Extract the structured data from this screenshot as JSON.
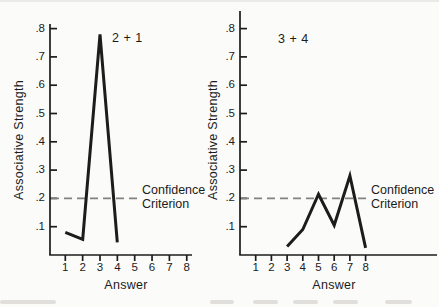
{
  "figure": {
    "background": "#fbfbf9",
    "ink": "#1c1c1c",
    "criterion_dash_color": "#828282"
  },
  "chart_data": [
    {
      "type": "line",
      "title": "2 + 1",
      "xlabel": "Answer",
      "ylabel": "Associative Strength",
      "x_tick_labels": [
        "1",
        "2",
        "3",
        "4",
        "5",
        "6",
        "7",
        "8"
      ],
      "y_tick_labels": [
        ".1",
        ".2",
        ".3",
        ".4",
        ".5",
        ".6",
        ".7",
        ".8"
      ],
      "y_tick_values": [
        0.1,
        0.2,
        0.3,
        0.4,
        0.5,
        0.6,
        0.7,
        0.8
      ],
      "ylim": [
        0,
        0.85
      ],
      "grid": false,
      "x": [
        1,
        2,
        3,
        4
      ],
      "y": [
        0.08,
        0.055,
        0.78,
        0.045
      ],
      "criterion": {
        "value": 0.2,
        "label_lines": [
          "Confidence",
          "Criterion"
        ]
      }
    },
    {
      "type": "line",
      "title": "3 + 4",
      "xlabel": "Answer",
      "ylabel": "Associative Strength",
      "x_tick_labels": [
        "1",
        "2",
        "3",
        "4",
        "5",
        "6",
        "7",
        "8"
      ],
      "y_tick_labels": [
        ".1",
        ".2",
        ".3",
        ".4",
        ".5",
        ".6",
        ".7",
        ".8"
      ],
      "y_tick_values": [
        0.1,
        0.2,
        0.3,
        0.4,
        0.5,
        0.6,
        0.7,
        0.8
      ],
      "ylim": [
        0,
        0.85
      ],
      "grid": false,
      "x": [
        3,
        4,
        5,
        6,
        7,
        8
      ],
      "y": [
        0.03,
        0.09,
        0.215,
        0.105,
        0.28,
        0.025
      ],
      "criterion": {
        "value": 0.2,
        "label_lines": [
          "Confidence",
          "Criterion"
        ]
      }
    }
  ]
}
